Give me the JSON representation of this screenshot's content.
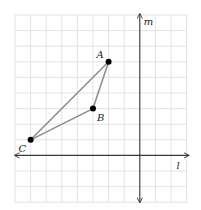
{
  "diagram": {
    "type": "coordinate-grid-triangle",
    "grid": {
      "left_px": 15,
      "top_px": 15,
      "cell_px": 15.6,
      "cols": 11,
      "rows": 12,
      "origin_col": 8,
      "origin_row": 9,
      "color": "#dcdcdc"
    },
    "axes": {
      "horizontal": {
        "label": "l"
      },
      "vertical": {
        "label": "m"
      },
      "color": "#3a3a3a"
    },
    "points": [
      {
        "name": "A",
        "label": "A",
        "x": -2,
        "y": 6
      },
      {
        "name": "B",
        "label": "B",
        "x": -3,
        "y": 3
      },
      {
        "name": "C",
        "label": "C",
        "x": -7,
        "y": 1
      }
    ],
    "edges": [
      [
        "A",
        "B"
      ],
      [
        "B",
        "C"
      ],
      [
        "C",
        "A"
      ]
    ],
    "edge_color": "#8a8a8a",
    "point_color": "#000000"
  }
}
